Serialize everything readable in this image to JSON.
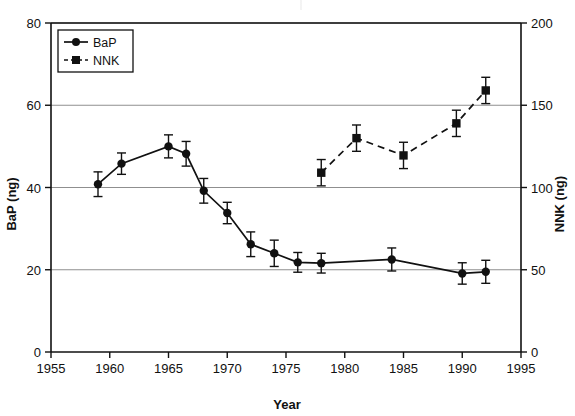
{
  "chart_data": {
    "type": "line",
    "title": "",
    "subtitle": "",
    "xlabel": "Year",
    "ylabel": "BaP (ng)",
    "y2label": "NNK (ng)",
    "xlim": [
      1955,
      1995
    ],
    "ylim": [
      0,
      80
    ],
    "y2lim": [
      0,
      200
    ],
    "xticks": [
      1955,
      1960,
      1965,
      1970,
      1975,
      1980,
      1985,
      1990,
      1995
    ],
    "xticklabels": [
      "1955",
      "1960",
      "1965",
      "1970",
      "1975",
      "1980",
      "1985",
      "1990",
      "1995"
    ],
    "yticks": [
      0,
      20,
      40,
      60,
      80
    ],
    "yticklabels": [
      "0",
      "20",
      "40",
      "60",
      "80"
    ],
    "y2ticks": [
      0,
      50,
      100,
      150,
      200
    ],
    "y2ticklabels": [
      "0",
      "50",
      "100",
      "150",
      "200"
    ],
    "grid": true,
    "grid_axis": "y",
    "legend_position": "upper left",
    "series": [
      {
        "name": "BaP",
        "axis": "left",
        "marker": "circle",
        "linestyle": "solid",
        "x": [
          1959,
          1961,
          1965,
          1966.5,
          1968,
          1970,
          1972,
          1974,
          1976,
          1978,
          1984,
          1990,
          1992
        ],
        "values": [
          40.8,
          45.8,
          50.0,
          48.2,
          39.2,
          33.8,
          26.2,
          24.0,
          21.8,
          21.6,
          22.5,
          19.1,
          19.5
        ],
        "yerr": [
          3.0,
          2.6,
          2.8,
          3.0,
          3.0,
          2.6,
          3.0,
          3.2,
          2.4,
          2.4,
          2.8,
          2.6,
          2.8
        ]
      },
      {
        "name": "NNK",
        "axis": "right",
        "marker": "square",
        "linestyle": "dashed",
        "x": [
          1978,
          1981,
          1985,
          1989.5,
          1992
        ],
        "values": [
          109,
          130,
          119.5,
          139,
          159
        ],
        "yerr": [
          8,
          8,
          8,
          8,
          8
        ]
      }
    ]
  },
  "legend": {
    "entries": [
      {
        "label": "BaP",
        "marker": "circle",
        "linestyle": "solid"
      },
      {
        "label": "NNK",
        "marker": "square",
        "linestyle": "dashed"
      }
    ]
  }
}
